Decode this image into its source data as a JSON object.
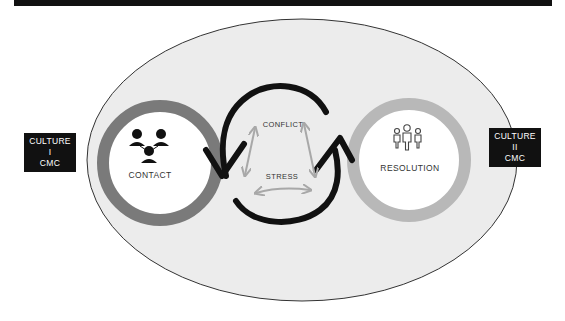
{
  "diagram": {
    "left_culture": {
      "line1": "CULTURE I",
      "line2": "CMC"
    },
    "right_culture": {
      "line1": "CULTURE II",
      "line2": "CMC"
    },
    "contact": {
      "label": "CONTACT",
      "icon": "network-people-icon",
      "ring_color": "#7a7a7a"
    },
    "resolution": {
      "label": "RESOLUTION",
      "icon": "group-people-icon",
      "ring_color": "#b8b8b8"
    },
    "center": {
      "conflict_label": "CONFLICT",
      "stress_label": "STRESS",
      "arrow_color": "#a8a8a8"
    },
    "colors": {
      "ellipse_fill": "#ececec",
      "ellipse_stroke": "#333333",
      "arc": "#111111",
      "label_bg": "#111111"
    }
  }
}
